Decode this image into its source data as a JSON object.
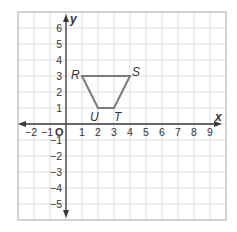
{
  "figure": {
    "type": "coordinate-plane",
    "axes": {
      "x_label": "x",
      "y_label": "y",
      "origin_label": "O",
      "x_ticks": [
        -2,
        -1,
        1,
        2,
        3,
        4,
        5,
        6,
        7,
        8,
        9
      ],
      "y_ticks": [
        -5,
        -4,
        -3,
        -2,
        -1,
        1,
        2,
        3,
        4,
        5,
        6
      ],
      "x_grid_range": [
        -3,
        10
      ],
      "y_grid_range": [
        -6,
        7
      ],
      "grid": true
    },
    "polygon": {
      "name": "RSTU",
      "vertices": [
        {
          "label": "R",
          "x": 1,
          "y": 3,
          "dx": -11,
          "dy": 3
        },
        {
          "label": "S",
          "x": 4,
          "y": 3,
          "dx": 2,
          "dy": 0
        },
        {
          "label": "T",
          "x": 3,
          "y": 1,
          "dx": 0,
          "dy": 13
        },
        {
          "label": "U",
          "x": 2,
          "y": 1,
          "dx": -8,
          "dy": 13
        }
      ]
    },
    "colors": {
      "grid": "#d4d4d4",
      "axes": "#3a3a3a",
      "shape": "#7a7a7a",
      "text": "#333333"
    }
  }
}
